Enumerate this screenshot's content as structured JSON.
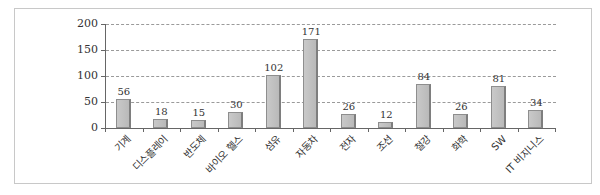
{
  "chart_data": {
    "type": "bar",
    "title": "",
    "xlabel": "",
    "ylabel": "",
    "ylim": [
      0,
      200
    ],
    "yticks": [
      "0",
      "50",
      "100",
      "150",
      "200"
    ],
    "grid": true,
    "legend": null,
    "categories": [
      "기계",
      "디스플레이",
      "반도체",
      "바이오 헬스",
      "섬유",
      "자동차",
      "전자",
      "조선",
      "철강",
      "화학",
      "SW",
      "IT 비지니스"
    ],
    "values": [
      56,
      18,
      15,
      30,
      102,
      171,
      26,
      12,
      84,
      26,
      81,
      34
    ],
    "value_labels": [
      "56",
      "18",
      "15",
      "30",
      "102",
      "171",
      "26",
      "12",
      "84",
      "26",
      "81",
      "34"
    ]
  },
  "colors": {
    "bar": "#c2c2c2",
    "bar_border": "#8e8e8e",
    "grid": "#9a9a9a",
    "axis": "#666666"
  }
}
